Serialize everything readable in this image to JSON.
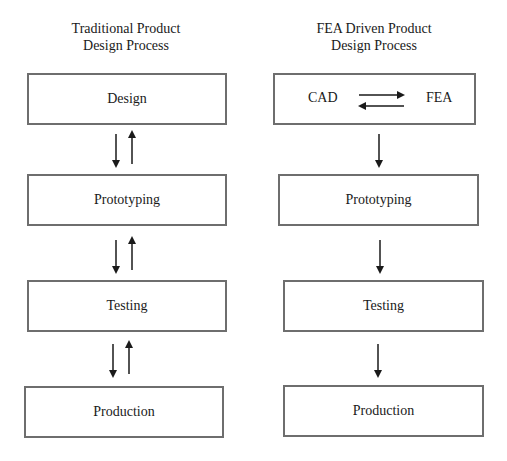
{
  "left_column": {
    "title_line1": "Traditional Product",
    "title_line2": "Design Process",
    "steps": [
      "Design",
      "Prototyping",
      "Testing",
      "Production"
    ],
    "connector": "bidirectional"
  },
  "right_column": {
    "title_line1": "FEA Driven Product",
    "title_line2": "Design Process",
    "first_step": {
      "left": "CAD",
      "right": "FEA",
      "connector": "bidirectional-horizontal"
    },
    "steps": [
      "Prototyping",
      "Testing",
      "Production"
    ],
    "connector": "downward"
  },
  "colors": {
    "box_border": "#6e6e6e",
    "arrow": "#1a1a1a",
    "text": "#1a1a1a"
  }
}
